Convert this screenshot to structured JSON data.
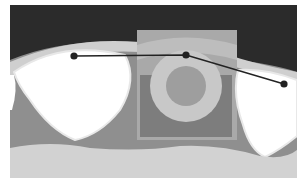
{
  "diagram": {
    "type": "dental-cross-section",
    "colors": {
      "background": "#ffffff",
      "air": "#2b2b2b",
      "soft_tissue": "#8f8f8f",
      "bone": "#d2d2d2",
      "tooth": "#ffffff",
      "tooth_outline": "#e6e6e6",
      "gum_band": "#cfcfcf",
      "implant_outer": "#a9a9a9",
      "implant_ring": "#c8c8c8",
      "implant_core": "#9e9e9e",
      "implant_block": "#7d7d7d",
      "measure_line": "#222222"
    },
    "measurement": {
      "points": [
        {
          "label": "left",
          "x": 74,
          "y": 56
        },
        {
          "label": "center",
          "x": 186,
          "y": 55
        },
        {
          "label": "right",
          "x": 284,
          "y": 84
        }
      ]
    }
  }
}
